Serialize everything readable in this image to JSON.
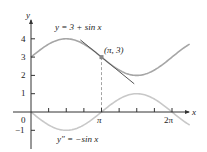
{
  "chart_data": {
    "type": "line",
    "title": "",
    "xlabel": "x",
    "ylabel": "y",
    "xlim": [
      -0.8,
      7.1
    ],
    "ylim": [
      -1.9,
      5.0
    ],
    "grid": false,
    "x_ticks": [
      {
        "value": 0,
        "label": "0"
      },
      {
        "value": 0.7854,
        "label": ""
      },
      {
        "value": 1.5708,
        "label": ""
      },
      {
        "value": 2.3562,
        "label": ""
      },
      {
        "value": 3.1416,
        "label": "π"
      },
      {
        "value": 3.927,
        "label": ""
      },
      {
        "value": 4.7124,
        "label": ""
      },
      {
        "value": 5.4978,
        "label": ""
      },
      {
        "value": 6.2832,
        "label": "2π"
      }
    ],
    "y_ticks": [
      {
        "value": -1,
        "label": "−1"
      },
      {
        "value": 1,
        "label": "1"
      },
      {
        "value": 2,
        "label": "2"
      },
      {
        "value": 3,
        "label": "3"
      },
      {
        "value": 4,
        "label": "4"
      }
    ],
    "series": [
      {
        "name": "y = 3 + sin x",
        "function": "3 + sin(x)",
        "x_range": [
          0,
          7.07
        ],
        "color": "#a6a6a6",
        "x": [
          0,
          0.785,
          1.571,
          2.356,
          3.142,
          3.927,
          4.712,
          5.498,
          6.283,
          7.07
        ],
        "values": [
          3,
          3.707,
          4,
          3.707,
          3,
          2.293,
          2,
          2.293,
          3,
          3.707
        ]
      },
      {
        "name": "y″ = −sin x",
        "function": "-sin(x)",
        "x_range": [
          0,
          7.07
        ],
        "color": "#c4c4c4",
        "x": [
          0,
          0.785,
          1.571,
          2.356,
          3.142,
          3.927,
          4.712,
          5.498,
          6.283,
          7.07
        ],
        "values": [
          0,
          -0.707,
          -1,
          -0.707,
          0,
          0.707,
          1,
          0.707,
          0,
          -0.707
        ]
      },
      {
        "name": "tangent at (π, 3)",
        "function": "3 - (x - π)",
        "x_range": [
          2.2,
          4.6
        ],
        "color": "#555555",
        "x": [
          2.2,
          4.6
        ],
        "values": [
          3.94,
          1.54
        ]
      }
    ],
    "annotations": [
      {
        "text": "(π, 3)",
        "x": 3.1416,
        "y": 3,
        "marker": "point"
      },
      {
        "text": "dashed vertical line from (π, 3) to x-axis",
        "x": 3.1416
      }
    ],
    "legend": "none (inline curve labels)"
  },
  "labels": {
    "curve_top": "y = 3 + sin x",
    "curve_bottom": "y″ = −sin x",
    "point": "(π, 3)",
    "x_axis": "x",
    "y_axis": "y",
    "origin": "0",
    "pi": "π",
    "two_pi": "2π",
    "y4": "4",
    "y3": "3",
    "y2": "2",
    "y1": "1",
    "ym1": "−1"
  },
  "colors": {
    "axis": "#333333",
    "curve_top": "#a6a6a6",
    "curve_bottom": "#c8c8c8",
    "tangent": "#555555",
    "dashed": "#9a9a9a"
  }
}
